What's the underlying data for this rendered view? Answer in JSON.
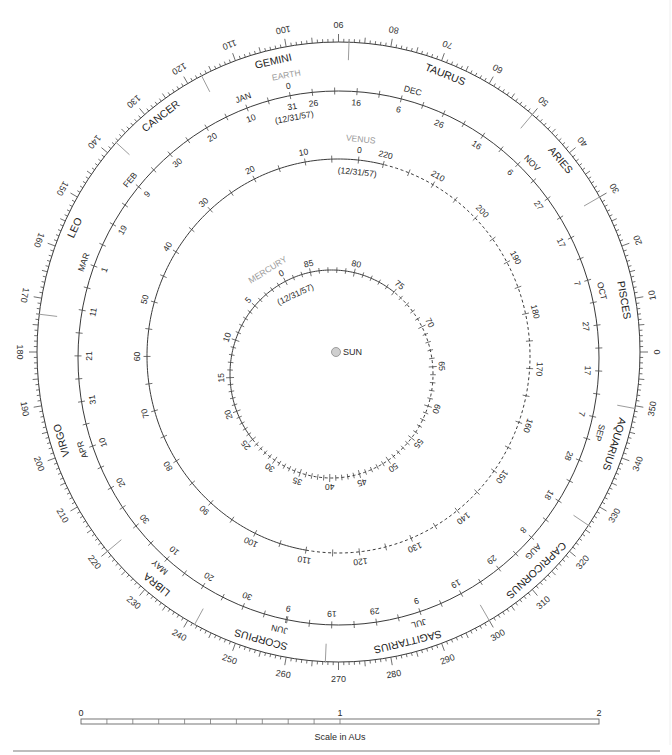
{
  "diagram": {
    "sun": {
      "label": "SUN"
    },
    "longitude_ring": {
      "label_step_deg": 10,
      "labels": [
        "0",
        "10",
        "20",
        "30",
        "40",
        "50",
        "60",
        "70",
        "80",
        "90",
        "100",
        "110",
        "120",
        "130",
        "140",
        "150",
        "160",
        "170",
        "180",
        "190",
        "200",
        "210",
        "220",
        "230",
        "240",
        "250",
        "260",
        "270",
        "280",
        "290",
        "300",
        "310",
        "320",
        "330",
        "340",
        "350"
      ],
      "minor_tick_deg": 1,
      "medium_tick_deg": 5,
      "major_tick_deg": 10
    },
    "zodiac": [
      {
        "name": "PISCES",
        "lon": 10
      },
      {
        "name": "ARIES",
        "lon": 40
      },
      {
        "name": "TAURUS",
        "lon": 68.4
      },
      {
        "name": "GEMINI",
        "lon": 103
      },
      {
        "name": "CANCER",
        "lon": 127.8
      },
      {
        "name": "LEO",
        "lon": 155.4
      },
      {
        "name": "VIRGO",
        "lon": 197.2
      },
      {
        "name": "LIBRA",
        "lon": 231.2
      },
      {
        "name": "SCORPIUS",
        "lon": 254.5
      },
      {
        "name": "SAGITTARIUS",
        "lon": 283.8
      },
      {
        "name": "CAPRICORNUS",
        "lon": 313
      },
      {
        "name": "AQUARIUS",
        "lon": 342
      }
    ],
    "zodiac_boundaries": [
      30,
      50,
      88,
      117,
      137.5,
      173,
      220,
      241.5,
      267.5,
      300,
      326,
      349.5
    ],
    "earth": {
      "name": "EARTH",
      "zero_label": "0",
      "epoch_label": "(12/31/57)",
      "lon_at_epoch": 100.7,
      "deg_per_day": 0.9856,
      "tick_days": {
        "from": -205,
        "to": 160,
        "step": 5
      },
      "day_labels": [
        {
          "d": 0,
          "text": "31"
        },
        {
          "d": 10,
          "text": "10"
        },
        {
          "d": 20,
          "text": "20"
        },
        {
          "d": 30,
          "text": "30"
        },
        {
          "d": 40,
          "text": "9"
        },
        {
          "d": 50,
          "text": "19"
        },
        {
          "d": 60,
          "text": "1"
        },
        {
          "d": 70,
          "text": "11"
        },
        {
          "d": 80,
          "text": "21"
        },
        {
          "d": 90,
          "text": "31"
        },
        {
          "d": 100,
          "text": "10"
        },
        {
          "d": 110,
          "text": "20"
        },
        {
          "d": 120,
          "text": "30"
        },
        {
          "d": 130,
          "text": "10"
        },
        {
          "d": 140,
          "text": "20"
        },
        {
          "d": 150,
          "text": "30"
        },
        {
          "d": 160,
          "text": "9"
        },
        {
          "d": -5,
          "text": "26"
        },
        {
          "d": -15,
          "text": "16"
        },
        {
          "d": -25,
          "text": "6"
        },
        {
          "d": -35,
          "text": "26"
        },
        {
          "d": -45,
          "text": "16"
        },
        {
          "d": -55,
          "text": "6"
        },
        {
          "d": -65,
          "text": "27"
        },
        {
          "d": -75,
          "text": "17"
        },
        {
          "d": -85,
          "text": "7"
        },
        {
          "d": -95,
          "text": "27"
        },
        {
          "d": -105,
          "text": "17"
        },
        {
          "d": -115,
          "text": "7"
        },
        {
          "d": -125,
          "text": "28"
        },
        {
          "d": -135,
          "text": "18"
        },
        {
          "d": -145,
          "text": "8"
        },
        {
          "d": -155,
          "text": "29"
        },
        {
          "d": -165,
          "text": "19"
        },
        {
          "d": -175,
          "text": "9"
        },
        {
          "d": -185,
          "text": "29"
        },
        {
          "d": -195,
          "text": "19"
        }
      ],
      "month_labels": [
        {
          "d": 10,
          "text": "JAN"
        },
        {
          "d": 40,
          "text": "FEB"
        },
        {
          "d": 60,
          "text": "MAR"
        },
        {
          "d": 100,
          "text": "APR"
        },
        {
          "d": 130,
          "text": "MAY"
        },
        {
          "d": 159,
          "text": "JUN"
        },
        {
          "d": -176,
          "text": "JUL"
        },
        {
          "d": -147,
          "text": "AUG"
        },
        {
          "d": -118,
          "text": "SEP"
        },
        {
          "d": -88,
          "text": "OCT"
        },
        {
          "d": -57,
          "text": "NOV"
        },
        {
          "d": -27,
          "text": "DEC"
        }
      ]
    },
    "venus": {
      "name": "VENUS",
      "epoch_label": "(12/31/57)",
      "lon_at_epoch": 84,
      "deg_per_day": 1.6021,
      "tick_days": {
        "from": 0,
        "to": 220,
        "step": 5
      },
      "labels": [
        {
          "d": 0,
          "text": "0"
        },
        {
          "d": 10,
          "text": "10"
        },
        {
          "d": 20,
          "text": "20"
        },
        {
          "d": 30,
          "text": "30"
        },
        {
          "d": 40,
          "text": "40"
        },
        {
          "d": 50,
          "text": "50"
        },
        {
          "d": 60,
          "text": "60"
        },
        {
          "d": 70,
          "text": "70"
        },
        {
          "d": 80,
          "text": "80"
        },
        {
          "d": 90,
          "text": "90"
        },
        {
          "d": 100,
          "text": "100"
        },
        {
          "d": 110,
          "text": "110"
        },
        {
          "d": 120,
          "text": "120"
        },
        {
          "d": 130,
          "text": "130"
        },
        {
          "d": 140,
          "text": "140"
        },
        {
          "d": 150,
          "text": "150"
        },
        {
          "d": 160,
          "text": "160"
        },
        {
          "d": 170,
          "text": "170"
        },
        {
          "d": 180,
          "text": "180"
        },
        {
          "d": 190,
          "text": "190"
        },
        {
          "d": 200,
          "text": "200"
        },
        {
          "d": 210,
          "text": "210"
        },
        {
          "d": 220,
          "text": "220"
        }
      ],
      "solid_arc_deg": [
        76.4,
        260.2
      ]
    },
    "mercury": {
      "name": "MERCURY",
      "epoch_label": "(12/31/57)",
      "period_days": 88,
      "labels": [
        {
          "d": 0,
          "angle_deg": 117,
          "text": "0"
        },
        {
          "d": 5,
          "angle_deg": 139,
          "text": "5"
        },
        {
          "d": 10,
          "angle_deg": 161,
          "text": "10"
        },
        {
          "d": 15,
          "angle_deg": 182,
          "text": "15"
        },
        {
          "d": 20,
          "angle_deg": 201,
          "text": "20"
        },
        {
          "d": 25,
          "angle_deg": 219,
          "text": "25"
        },
        {
          "d": 30,
          "angle_deg": 236,
          "text": "30"
        },
        {
          "d": 35,
          "angle_deg": 252,
          "text": "35"
        },
        {
          "d": 40,
          "angle_deg": 269,
          "text": "40"
        },
        {
          "d": 45,
          "angle_deg": 286,
          "text": "45"
        },
        {
          "d": 50,
          "angle_deg": 304,
          "text": "50"
        },
        {
          "d": 55,
          "angle_deg": 322,
          "text": "55"
        },
        {
          "d": 60,
          "angle_deg": 342,
          "text": "60"
        },
        {
          "d": 65,
          "angle_deg": 364,
          "text": "65"
        },
        {
          "d": 70,
          "angle_deg": 387,
          "text": "70"
        },
        {
          "d": 75,
          "angle_deg": 412,
          "text": "75"
        },
        {
          "d": 80,
          "angle_deg": 437,
          "text": "80"
        },
        {
          "d": 85,
          "angle_deg": 462,
          "text": "85"
        }
      ],
      "solid_arc_deg": [
        52,
        219
      ]
    }
  },
  "scale_bar": {
    "labels": [
      "0",
      "1",
      "2"
    ],
    "caption": "Scale in AUs",
    "subdivisions_first_unit": 10
  }
}
